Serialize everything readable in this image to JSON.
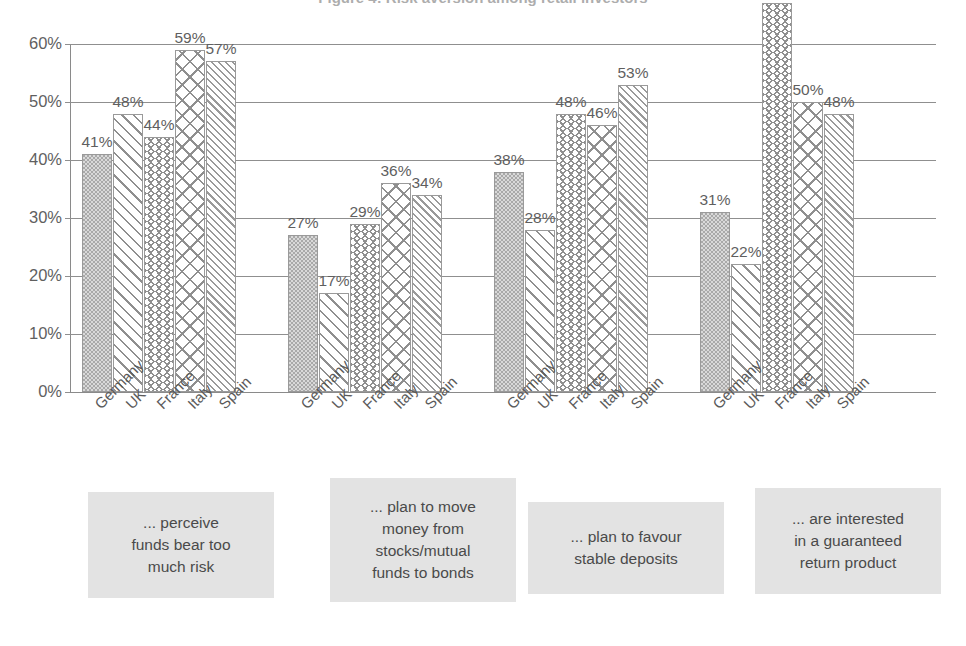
{
  "title": "Figure 4: Risk aversion among retail investors",
  "chart_data": {
    "type": "bar",
    "title": "Figure 4: Risk aversion among retail investors",
    "xlabel": "",
    "ylabel": "",
    "ylim": [
      0,
      60
    ],
    "ytick_labels": [
      "0%",
      "10%",
      "20%",
      "30%",
      "40%",
      "50%",
      "60%"
    ],
    "ytick_values": [
      0,
      10,
      20,
      30,
      40,
      50,
      60
    ],
    "grid": true,
    "legend": "none",
    "value_suffix": "%",
    "categories": [
      "Germany",
      "UK",
      "France",
      "Italy",
      "Spain"
    ],
    "groups": [
      {
        "caption": [
          "... perceive",
          "funds bear too",
          "much risk"
        ],
        "values": [
          41,
          48,
          44,
          59,
          57
        ],
        "labels": [
          "41%",
          "48%",
          "44%",
          "59%",
          "57%"
        ]
      },
      {
        "caption": [
          "... plan to move",
          "money from",
          "stocks/mutual",
          "funds to bonds"
        ],
        "values": [
          27,
          17,
          29,
          36,
          34
        ],
        "labels": [
          "27%",
          "17%",
          "29%",
          "36%",
          "34%"
        ]
      },
      {
        "caption": [
          "... plan to favour",
          "stable deposits"
        ],
        "values": [
          38,
          28,
          48,
          46,
          53
        ],
        "labels": [
          "38%",
          "28%",
          "48%",
          "46%",
          "53%"
        ]
      },
      {
        "caption": [
          "... are interested",
          "in a guaranteed",
          "return product"
        ],
        "values": [
          31,
          22,
          67,
          50,
          48
        ],
        "labels": [
          "31%",
          "22%",
          "67%",
          "50%",
          "48%"
        ]
      }
    ],
    "series_patterns": {
      "Germany": "checker-fill",
      "UK": "diagonal-stripe",
      "France": "wavy-zigzag",
      "Italy": "brick-crosshatch",
      "Spain": "fine-diagonal-stripe"
    },
    "colors": {
      "bar_outline": "#9a9a9a",
      "pattern": "#8f9090",
      "germany_fill": "#a9a9a9",
      "gridline": "#8f8f8f",
      "text": "#5f5f5f",
      "caption_box": "#e3e3e3",
      "background": "#ffffff"
    }
  }
}
